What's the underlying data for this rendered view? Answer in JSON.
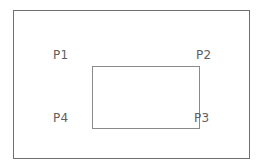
{
  "figure": {
    "background_color": "#ffffff",
    "outer_frame": {
      "name": "outer-border",
      "stroke_color": "#6f6f6f",
      "stroke_width": 1
    },
    "inner_rectangle": {
      "name": "inner-rectangle",
      "stroke_color": "#8a8a8a",
      "stroke_width": 1,
      "fill": "none"
    },
    "label_color": "#5e5e5e",
    "points": [
      {
        "id": "P1",
        "label": "P1",
        "corner": "top-left",
        "label_side": "left"
      },
      {
        "id": "P2",
        "label": "P2",
        "corner": "top-right",
        "label_side": "right"
      },
      {
        "id": "P3",
        "label": "P3",
        "corner": "bottom-right",
        "label_side": "right"
      },
      {
        "id": "P4",
        "label": "P4",
        "corner": "bottom-left",
        "label_side": "left"
      }
    ]
  }
}
